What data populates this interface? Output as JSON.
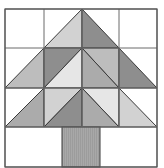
{
  "figure": {
    "grid": {
      "cols": 4,
      "rows": 4,
      "x": [
        5,
        44,
        82,
        119,
        157
      ],
      "y": [
        9,
        48,
        88,
        127,
        167
      ]
    },
    "colors": {
      "white": "#ffffff",
      "very_light": "#e6e6e6",
      "light": "#d2d2d2",
      "medium_light": "#bdbdbd",
      "medium": "#ababab",
      "dark": "#8e8e8e",
      "trunk": "#a8a8a8",
      "line": "#3a3a3a"
    },
    "triangles": [
      {
        "name": "r0c1-lower-right",
        "points": "44,48 82,9 82,48",
        "fill": "light"
      },
      {
        "name": "r0c2-lower-left",
        "points": "82,9 119,48 82,48",
        "fill": "dark"
      },
      {
        "name": "r1c0-lower-right",
        "points": "5,88 44,48 44,88",
        "fill": "medium_light"
      },
      {
        "name": "r1c1-upper-left",
        "points": "44,48 82,48 44,88",
        "fill": "dark"
      },
      {
        "name": "r1c1-lower-right",
        "points": "82,48 82,88 44,88",
        "fill": "very_light"
      },
      {
        "name": "r1c2-upper-right",
        "points": "82,48 119,48 119,88",
        "fill": "medium_light"
      },
      {
        "name": "r1c2-lower-left",
        "points": "82,48 119,88 82,88",
        "fill": "medium"
      },
      {
        "name": "r1c3-lower-left",
        "points": "119,48 157,88 119,88",
        "fill": "dark"
      },
      {
        "name": "r2c0-lower-right",
        "points": "5,127 44,88 44,127",
        "fill": "medium"
      },
      {
        "name": "r2c1-upper-left",
        "points": "44,88 82,88 44,127",
        "fill": "light"
      },
      {
        "name": "r2c1-lower-right",
        "points": "82,88 82,127 44,127",
        "fill": "dark"
      },
      {
        "name": "r2c2-upper-right",
        "points": "82,88 119,88 119,127",
        "fill": "very_light"
      },
      {
        "name": "r2c2-lower-left",
        "points": "82,88 119,127 82,127",
        "fill": "medium"
      },
      {
        "name": "r2c3-lower-left",
        "points": "119,88 157,127 119,127",
        "fill": "light"
      }
    ],
    "trunk": {
      "x": 62,
      "y": 127,
      "w": 38,
      "h": 40
    }
  }
}
